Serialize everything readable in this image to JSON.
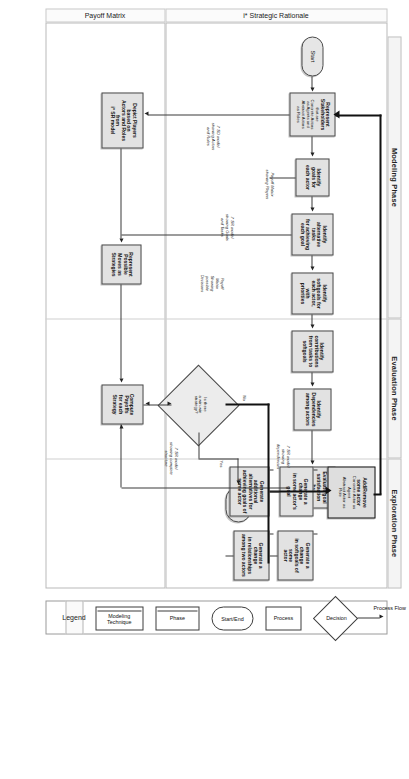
{
  "diagram": {
    "orientation": "landscape-rotated-90",
    "phases": [
      {
        "id": "modeling",
        "label": "Modeling Phase"
      },
      {
        "id": "evaluation",
        "label": "Evaluation Phase"
      },
      {
        "id": "exploration",
        "label": "Exploration Phase"
      }
    ],
    "lanes": [
      {
        "id": "sr",
        "label": "i* Strategic Rationale"
      },
      {
        "id": "payoff",
        "label": "Payoff Matrix"
      }
    ],
    "nodes": {
      "start": {
        "label": "Start",
        "shape": "start-end"
      },
      "end": {
        "label": "End",
        "shape": "start-end"
      },
      "represent_stakeholders": {
        "shape": "process",
        "line1": "Represent",
        "line2": "Stakeholders",
        "line3": "that are",
        "line4": "Concrete Actors",
        "line5": "as Agents and",
        "line6": "Abstract Actors",
        "line7": "as Roles"
      },
      "identify_goals": {
        "shape": "process",
        "line1": "Identify",
        "line2": "goals for",
        "line3": "each actor"
      },
      "identify_alternatives": {
        "shape": "process",
        "line1": "Identify",
        "line2": "alternative tasks",
        "line3": "for achieving",
        "line4": "each goal"
      },
      "identify_softgoals": {
        "shape": "process",
        "line1": "Identify",
        "line2": "softgoals for",
        "line3": "each actor, with",
        "line4": "priorities"
      },
      "identify_contributions": {
        "shape": "process",
        "line1": "Identify",
        "line2": "contributions",
        "line3": "from tasks to",
        "line4": "softgoals"
      },
      "identify_dependencies": {
        "shape": "process",
        "line1": "Identify",
        "line2": "Dependencies",
        "line3": "among actors"
      },
      "evaluate_goal_sat": {
        "shape": "process",
        "line1": "Evaluate goal",
        "line2": "satisfaction",
        "line3": "by",
        "line4": "propagating",
        "line5": "labels"
      },
      "compute_payoffs": {
        "shape": "process",
        "line1": "Compute",
        "line2": "Payoffs",
        "line3": "for each",
        "line4": "Strategy"
      },
      "depict_players": {
        "shape": "process",
        "line1": "Depict Players based on",
        "line2": "Actors and Roles from",
        "line3": "i* SR model"
      },
      "represent_moves": {
        "shape": "process",
        "line1": "Represent",
        "line2": "Possible",
        "line3": "Moves as",
        "line4": "Strategies"
      },
      "decision_winwin": {
        "shape": "decision",
        "line1": "Is there",
        "line2": "a win-win",
        "line3": "strategy?"
      },
      "add_remove_actor": {
        "shape": "process",
        "emphasis": true,
        "line1": "Add/Remove",
        "line2": "some actor",
        "line3": "Concrete Actor as",
        "line4": "Agent",
        "line5": "Abstract Actor as",
        "line6": "Role"
      },
      "gen_change_goal": {
        "shape": "process",
        "line1": "Generate a change",
        "line2": "in some actor's goal"
      },
      "gen_alternatives": {
        "shape": "process",
        "line1": "Generate",
        "line2": "additional",
        "line3": "alternatives for",
        "line4": "achieving goals of",
        "line5": "some actor"
      },
      "gen_change_softgoals": {
        "shape": "process",
        "line1": "Generate a change",
        "line2": "in softgoals of some",
        "line3": "actor"
      },
      "gen_change_rel": {
        "shape": "process",
        "line1": "Generate a change",
        "line2": "in relationships",
        "line3": "among two actors"
      }
    },
    "annotations": {
      "sd_model": "i* SD model\nshowing Actors\nand Roles",
      "sr_goals_tasks": "i* SR model\nshowing Goals\nand Tasks",
      "sr_dependencies": "i* SR model\nshowing\ndependencies",
      "sr_complete": "i* SR model\nshowing complete\nstructure",
      "payoff_players": "Payoff Matrix\nshowing Players",
      "payoff_decisions": "Payoff\nMatrix\nShowing\npossible\nDecisions"
    },
    "edge_labels": {
      "yes": "Yes",
      "no": "No"
    },
    "legend": {
      "title": "Legend",
      "items": [
        {
          "id": "modeling-technique",
          "label": "Modeling\nTechnique",
          "shape": "phase-band"
        },
        {
          "id": "phase",
          "label": "Phase",
          "shape": "phase-band"
        },
        {
          "id": "start-end",
          "label": "Start/End",
          "shape": "rounded"
        },
        {
          "id": "process",
          "label": "Process",
          "shape": "rect"
        },
        {
          "id": "decision",
          "label": "Decision",
          "shape": "diamond"
        },
        {
          "id": "process-flow",
          "label": "Process Flow",
          "shape": "arrow"
        }
      ]
    }
  }
}
